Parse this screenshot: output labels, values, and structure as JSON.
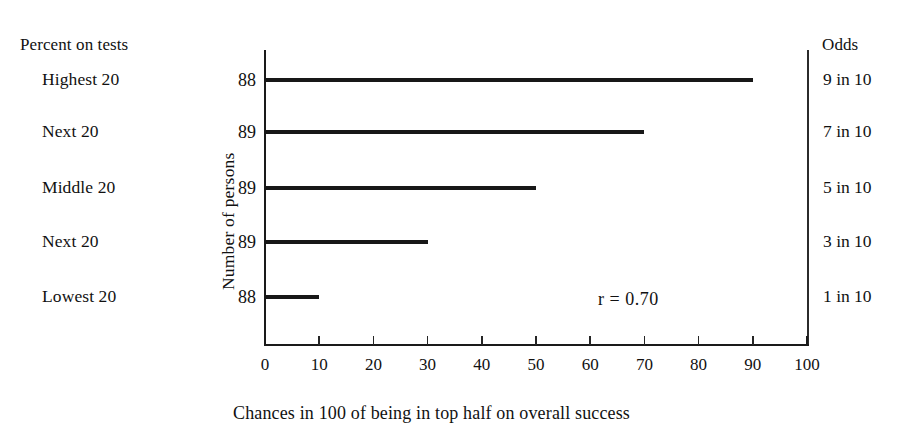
{
  "headers": {
    "left": "Percent on tests",
    "middle": "Number of persons",
    "right": "Odds"
  },
  "annotation": "r = 0.70",
  "x_caption": "Chances in 100 of being in top half on overall success",
  "rows": [
    {
      "group": "Highest 20",
      "count": "88",
      "odds": "9 in 10",
      "value": 90
    },
    {
      "group": "Next 20",
      "count": "89",
      "odds": "7 in 10",
      "value": 70
    },
    {
      "group": "Middle 20",
      "count": "89",
      "odds": "5 in 10",
      "value": 50
    },
    {
      "group": "Next 20",
      "count": "89",
      "odds": "3 in 10",
      "value": 30
    },
    {
      "group": "Lowest 20",
      "count": "88",
      "odds": "1 in 10",
      "value": 10
    }
  ],
  "x_ticks": [
    "0",
    "10",
    "20",
    "30",
    "40",
    "50",
    "60",
    "70",
    "80",
    "90",
    "100"
  ],
  "colors": {
    "background": "#ffffff",
    "ink": "#111111",
    "bar": "#181818",
    "axis": "#1a1a1a"
  },
  "chart_data": {
    "type": "bar",
    "orientation": "horizontal",
    "title": "",
    "subtitle": "",
    "xlabel": "Chances in 100 of being in top half on overall success",
    "ylabel": "Number of persons",
    "categories": [
      "Highest 20",
      "Next 20",
      "Middle 20",
      "Next 20",
      "Lowest 20"
    ],
    "values": [
      90,
      70,
      50,
      30,
      10
    ],
    "xlim": [
      0,
      100
    ],
    "xticks": [
      0,
      10,
      20,
      30,
      40,
      50,
      60,
      70,
      80,
      90,
      100
    ],
    "grid": false,
    "legend": "none",
    "annotations": [
      "r = 0.70"
    ],
    "left_axis_header": "Percent on tests",
    "right_axis_header": "Odds",
    "counts": [
      88,
      89,
      89,
      89,
      88
    ],
    "odds": [
      "9 in 10",
      "7 in 10",
      "5 in 10",
      "3 in 10",
      "1 in 10"
    ],
    "correlation": 0.7
  },
  "geometry": {
    "x0_px": 265,
    "x100_px": 807,
    "axis_top_px": 50,
    "axis_bottom_px": 345,
    "row_y_px": [
      80,
      132,
      188,
      242,
      297
    ]
  }
}
